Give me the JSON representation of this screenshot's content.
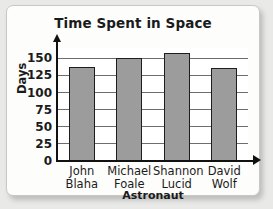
{
  "chart_data": {
    "type": "bar",
    "title": "Time Spent in Space",
    "xlabel": "Astronaut",
    "ylabel": "Days",
    "categories": [
      "John Blaha",
      "Michael Foale",
      "Shannon Lucid",
      "David Wolf"
    ],
    "category_lines": [
      {
        "line1": "John",
        "line2": "Blaha"
      },
      {
        "line1": "Michael",
        "line2": "Foale"
      },
      {
        "line1": "Shannon",
        "line2": "Lucid"
      },
      {
        "line1": "David",
        "line2": "Wolf"
      }
    ],
    "values": [
      138,
      150,
      158,
      136
    ],
    "ylim": [
      0,
      165
    ],
    "yticks": [
      0,
      25,
      50,
      75,
      100,
      125,
      150
    ],
    "ytick_labels": [
      "0",
      "25",
      "50",
      "75",
      "100",
      "125",
      "150"
    ],
    "grid": true,
    "legend": false,
    "bar_color": "#9c9c9c",
    "bar_edge_color": "#1d1d1d",
    "axis_color": "#111111",
    "grid_color": "#6d6d6d",
    "text_color": "#1b1b1b",
    "plot_background": "#ffffff",
    "card_background": "#fdfdfc",
    "page_background": "#e9e9e7"
  }
}
